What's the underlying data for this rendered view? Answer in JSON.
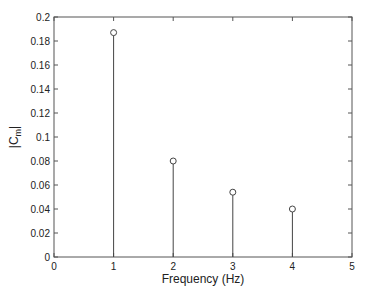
{
  "chart_data": {
    "type": "stem",
    "title": "",
    "xlabel": "Frequency (Hz)",
    "ylabel": "|C_m|",
    "ylabel_main": "|C",
    "ylabel_sub": "m",
    "ylabel_end": "|",
    "xlim": [
      0,
      5
    ],
    "ylim": [
      0,
      0.2
    ],
    "x": [
      1,
      2,
      3,
      4
    ],
    "values": [
      0.187,
      0.08,
      0.054,
      0.04
    ],
    "xticks": [
      "0",
      "1",
      "2",
      "3",
      "4",
      "5"
    ],
    "yticks": [
      "0",
      "0.02",
      "0.04",
      "0.06",
      "0.08",
      "0.1",
      "0.12",
      "0.14",
      "0.16",
      "0.18",
      "0.2"
    ],
    "grid": false,
    "legend": null
  },
  "colors": {
    "stem": "#444444",
    "axes": "#555555",
    "text": "#222222"
  }
}
